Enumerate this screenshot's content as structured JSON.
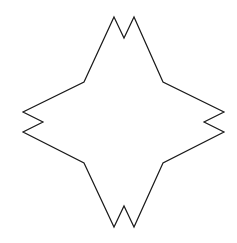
{
  "canvas": {
    "width": 237,
    "height": 243,
    "background": "#ffffff"
  },
  "shape": {
    "type": "four-pointed-star-with-notched-tips",
    "stroke": "#1a1a1a",
    "stroke_width": 1.2,
    "fill": "none",
    "points": "114,17 124,38 134,17 163,82 224,112 204,122 224,132 163,163 134,227 124,206 114,227 84,163 23,132 43,122 23,112 84,82"
  }
}
